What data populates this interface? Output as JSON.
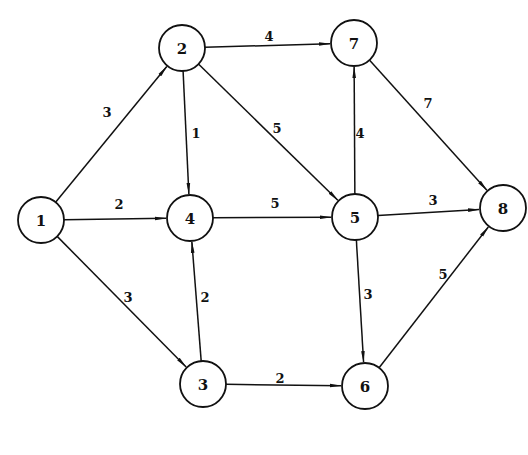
{
  "diagram": {
    "type": "directed-weighted-graph",
    "node_radius": 23,
    "nodes": [
      {
        "id": "1",
        "label": "1",
        "x": 41,
        "y": 220
      },
      {
        "id": "2",
        "label": "2",
        "x": 182,
        "y": 48
      },
      {
        "id": "3",
        "label": "3",
        "x": 203,
        "y": 384
      },
      {
        "id": "4",
        "label": "4",
        "x": 190,
        "y": 218
      },
      {
        "id": "5",
        "label": "5",
        "x": 355,
        "y": 217
      },
      {
        "id": "6",
        "label": "6",
        "x": 365,
        "y": 386
      },
      {
        "id": "7",
        "label": "7",
        "x": 354,
        "y": 43
      },
      {
        "id": "8",
        "label": "8",
        "x": 503,
        "y": 208
      }
    ],
    "edges": [
      {
        "from": "1",
        "to": "2",
        "weight": "3",
        "lx": 107,
        "ly": 112
      },
      {
        "from": "1",
        "to": "4",
        "weight": "2",
        "lx": 119,
        "ly": 204
      },
      {
        "from": "1",
        "to": "3",
        "weight": "3",
        "lx": 128,
        "ly": 297
      },
      {
        "from": "2",
        "to": "7",
        "weight": "4",
        "lx": 269,
        "ly": 36
      },
      {
        "from": "2",
        "to": "4",
        "weight": "1",
        "lx": 196,
        "ly": 133
      },
      {
        "from": "2",
        "to": "5",
        "weight": "5",
        "lx": 277,
        "ly": 128
      },
      {
        "from": "4",
        "to": "5",
        "weight": "5",
        "lx": 275,
        "ly": 203
      },
      {
        "from": "3",
        "to": "4",
        "weight": "2",
        "lx": 205,
        "ly": 297
      },
      {
        "from": "5",
        "to": "7",
        "weight": "4",
        "lx": 360,
        "ly": 133
      },
      {
        "from": "7",
        "to": "8",
        "weight": "7",
        "lx": 428,
        "ly": 103
      },
      {
        "from": "5",
        "to": "8",
        "weight": "3",
        "lx": 433,
        "ly": 200
      },
      {
        "from": "5",
        "to": "6",
        "weight": "3",
        "lx": 368,
        "ly": 294
      },
      {
        "from": "3",
        "to": "6",
        "weight": "2",
        "lx": 280,
        "ly": 378
      },
      {
        "from": "6",
        "to": "8",
        "weight": "5",
        "lx": 443,
        "ly": 274
      }
    ]
  }
}
